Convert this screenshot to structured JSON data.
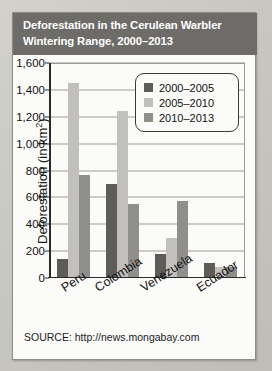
{
  "card": {
    "title_line_1": "Deforestation in the Cerulean Warbler",
    "title_line_2": "Wintering Range, 2000–2013",
    "source": "SOURCE: http://news.mongabay.com"
  },
  "legend": {
    "items": [
      {
        "label": "2000–2005",
        "color": "#5e5c59"
      },
      {
        "label": "2005–2010",
        "color": "#c2c0bc"
      },
      {
        "label": "2010–2013",
        "color": "#918f8b"
      }
    ]
  },
  "axis": {
    "ylabel_main": "Deforestation (in km",
    "ylabel_sup": "2",
    "ylabel_close": ")",
    "yticks": [
      "1,600",
      "1,400",
      "1,200",
      "1,000",
      "800",
      "600",
      "400",
      "200",
      "0"
    ]
  },
  "chart_data": {
    "type": "bar",
    "title": "Deforestation in the Cerulean Warbler Wintering Range, 2000–2013",
    "xlabel": "",
    "ylabel": "Deforestation (in km²)",
    "ylim": [
      0,
      1600
    ],
    "ytick_step": 200,
    "grid": true,
    "legend_position": "upper-right-inside",
    "categories": [
      "Peru",
      "Colombia",
      "Venezuela",
      "Ecuador"
    ],
    "series": [
      {
        "name": "2000–2005",
        "color": "#5e5c59",
        "values": [
          140,
          700,
          180,
          110
        ]
      },
      {
        "name": "2005–2010",
        "color": "#c2c0bc",
        "values": [
          1450,
          1240,
          300,
          85
        ]
      },
      {
        "name": "2010–2013",
        "color": "#918f8b",
        "values": [
          765,
          550,
          575,
          80
        ]
      }
    ],
    "source": "SOURCE: http://news.mongabay.com"
  }
}
